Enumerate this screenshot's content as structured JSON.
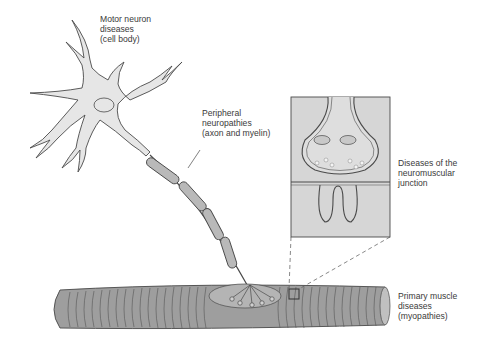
{
  "diagram": {
    "labels": {
      "motor_neuron": "Motor neuron\ndiseases\n(cell body)",
      "peripheral": "Peripheral\nneuropathies\n(axon and myelin)",
      "nmj": "Diseases of the\nneuromuscular\njunction",
      "muscle": "Primary muscle\ndiseases\n(myopathies)"
    },
    "colors": {
      "fill_light": "#e4e4e4",
      "fill_mid": "#b8b8b8",
      "fill_dark": "#9a9a9a",
      "stroke": "#4a4a4a",
      "inset_bg": "#d6d6d6"
    }
  }
}
